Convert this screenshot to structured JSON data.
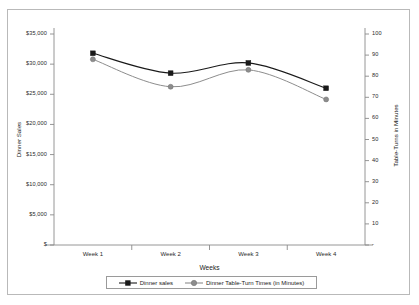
{
  "chart_data": {
    "type": "line",
    "title": "",
    "xlabel": "Weeks",
    "categories": [
      "Week 1",
      "Week 2",
      "Week 3",
      "Week 4"
    ],
    "grid": false,
    "legend_position": "bottom",
    "series": [
      {
        "name": "Dinner sales",
        "axis": "left",
        "marker": "square",
        "color": "#1a1a1a",
        "values": [
          31800,
          28500,
          30200,
          26000
        ]
      },
      {
        "name": "Dinner Table-Turn Times (in Minutes)",
        "axis": "right",
        "marker": "circle",
        "color": "#8d8d8d",
        "values": [
          88,
          75,
          83,
          69
        ]
      }
    ],
    "axis_left": {
      "label": "Dinner Sales",
      "ylim": [
        0,
        35000
      ],
      "ticks": [
        0,
        5000,
        10000,
        15000,
        20000,
        25000,
        30000,
        35000
      ],
      "tick_labels": [
        "$",
        "$5,000",
        "$10,000",
        "$15,000",
        "$20,000",
        "$25,000",
        "$30,000",
        "$35,000"
      ]
    },
    "axis_right": {
      "label": "Table-Turns in Minutes",
      "ylim": [
        0,
        100
      ],
      "ticks": [
        0,
        10,
        20,
        30,
        40,
        50,
        60,
        70,
        80,
        90,
        100
      ],
      "tick_labels": [
        "-",
        "10",
        "20",
        "30",
        "40",
        "50",
        "60",
        "70",
        "80",
        "90",
        "100"
      ]
    }
  },
  "legend": {
    "entries": [
      {
        "label": "Dinner sales",
        "marker": "square",
        "color": "#1a1a1a"
      },
      {
        "label": "Dinner Table-Turn Times (in Minutes)",
        "marker": "circle",
        "color": "#8d8d8d"
      }
    ]
  }
}
